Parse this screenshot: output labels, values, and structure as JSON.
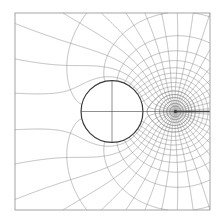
{
  "figure": {
    "title": "",
    "colors": {
      "background": "#ffffff",
      "grid_line": "#8a8a8a",
      "frame": "#9a9a9a",
      "cylinder": "#3a3a3a",
      "cut_line": "#444444"
    },
    "model": {
      "cylinder_radius": 1.0,
      "source_position": 2.05,
      "domain_half_width": 3.15,
      "streamline_count": 36,
      "equipotential_levels": [
        -2.0,
        -1.6,
        -1.3,
        -1.05,
        -0.85,
        -0.65,
        -0.45,
        -0.28,
        -0.12,
        0.03,
        0.18,
        0.35,
        0.55,
        0.8,
        1.1,
        1.5,
        2.0
      ]
    }
  }
}
